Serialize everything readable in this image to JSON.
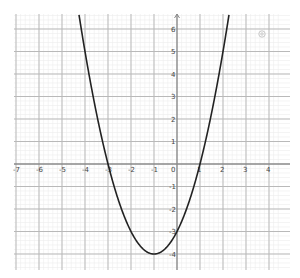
{
  "chart_data": {
    "type": "line",
    "title": "",
    "xlabel": "",
    "ylabel": "",
    "function": "y = x^2 + 2x - 3",
    "vertex": [
      -1,
      -4
    ],
    "roots": [
      -3,
      1
    ],
    "y_intercept": -3,
    "xlim": [
      -7,
      4.6
    ],
    "ylim": [
      -4.7,
      6.6
    ],
    "grid": true,
    "x_ticks": [
      -7,
      -6,
      -5,
      -4,
      -3,
      -2,
      -1,
      0,
      1,
      2,
      3,
      4
    ],
    "y_ticks": [
      -4,
      -3,
      -2,
      -1,
      1,
      2,
      3,
      4,
      5,
      6
    ],
    "series": [
      {
        "name": "f(x)",
        "x": [
          -4.4,
          -4,
          -3.5,
          -3,
          -2.5,
          -2,
          -1.5,
          -1,
          -0.5,
          0,
          0.5,
          1,
          1.5,
          2,
          2.4
        ],
        "values": [
          7.56,
          5,
          2.25,
          0,
          -1.75,
          -3,
          -3.75,
          -4,
          -3.75,
          -3,
          -1.75,
          0,
          2.25,
          5,
          7.56
        ]
      }
    ]
  },
  "tick_labels": {
    "x": [
      "-7",
      "-6",
      "-5",
      "-4",
      "-3",
      "-2",
      "-1",
      "0",
      "1",
      "2",
      "3",
      "4"
    ],
    "y": [
      "6",
      "5",
      "4",
      "3",
      "2",
      "1",
      "-1",
      "-2",
      "-3",
      "-4"
    ]
  },
  "controls": {
    "settings_icon": "gear-icon"
  }
}
